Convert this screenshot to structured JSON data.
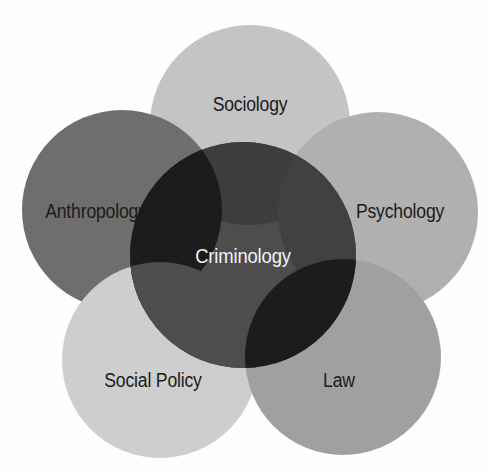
{
  "diagram": {
    "type": "venn",
    "background_color": "#fefefe",
    "center": {
      "label": "Criminology",
      "fill": "#4d4d4d",
      "text_color": "#f2f2f2",
      "cx": 243,
      "cy": 255,
      "r": 113
    },
    "circles": [
      {
        "label": "Sociology",
        "fill": "#c4c4c4",
        "text_color": "#1b1b1b",
        "cx": 250,
        "cy": 125,
        "r": 100,
        "label_x": 250,
        "label_y": 104,
        "overlap_fill": "#3d3d3d"
      },
      {
        "label": "Anthropology",
        "fill": "#6e6e6e",
        "text_color": "#1b1b1b",
        "cx": 122,
        "cy": 210,
        "r": 100,
        "label_x": 96,
        "label_y": 211,
        "overlap_fill": "#1c1c1c"
      },
      {
        "label": "Psychology",
        "fill": "#b0b0b0",
        "text_color": "#1b1b1b",
        "cx": 378,
        "cy": 212,
        "r": 100,
        "label_x": 400,
        "label_y": 211,
        "overlap_fill": "#414141"
      },
      {
        "label": "Social Policy",
        "fill": "#cecece",
        "text_color": "#1b1b1b",
        "cx": 160,
        "cy": 360,
        "r": 98,
        "label_x": 153,
        "label_y": 380,
        "overlap_fill": "#4d4d4d"
      },
      {
        "label": "Law",
        "fill": "#a0a0a0",
        "text_color": "#1b1b1b",
        "cx": 343,
        "cy": 357,
        "r": 98,
        "label_x": 339,
        "label_y": 380,
        "overlap_fill": "#1c1c1c"
      }
    ]
  }
}
